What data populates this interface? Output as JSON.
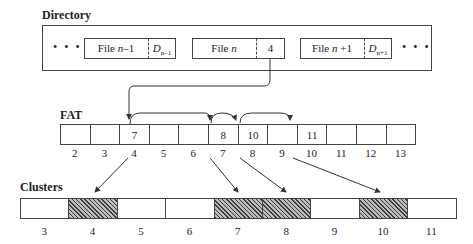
{
  "directory": {
    "title": "Directory",
    "ellipsis_left": "• • •",
    "ellipsis_right": "• • •",
    "entries": [
      {
        "name_prefix": "File ",
        "name_var": "n",
        "name_suffix": "–1",
        "pointer_var": "D",
        "pointer_sub": "n–1"
      },
      {
        "name_prefix": "File ",
        "name_var": "n",
        "name_suffix": "",
        "pointer_value": "4"
      },
      {
        "name_prefix": "File ",
        "name_var": "n",
        "name_suffix": " +1",
        "pointer_var": "D",
        "pointer_sub": "n+1"
      }
    ]
  },
  "fat": {
    "title": "FAT",
    "indices": [
      "2",
      "3",
      "4",
      "5",
      "6",
      "7",
      "8",
      "9",
      "10",
      "11",
      "12",
      "13"
    ],
    "values": [
      "",
      "",
      "7",
      "",
      "",
      "8",
      "10",
      "",
      "11",
      "",
      "",
      ""
    ]
  },
  "clusters": {
    "title": "Clusters",
    "indices": [
      "3",
      "4",
      "5",
      "6",
      "7",
      "8",
      "9",
      "10",
      "11"
    ],
    "allocated": [
      false,
      true,
      false,
      false,
      true,
      true,
      false,
      true,
      false
    ]
  },
  "colors": {
    "line": "#444444",
    "hatch_dark": "#3a3a3a",
    "hatch_light": "#bdbdbd"
  }
}
